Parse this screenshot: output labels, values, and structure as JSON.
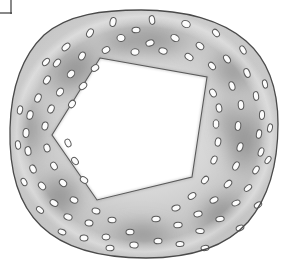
{
  "figure": {
    "title": "Stem cross-section",
    "style": "grayscale pencil and wash scientific illustration",
    "canvas": {
      "width": 282,
      "height": 263,
      "background": "#ffffff"
    }
  },
  "corner_mark": {
    "name": "crop-corner-bracket",
    "visible": true,
    "color": "#3a3a3a",
    "vertical_x": 11,
    "vertical_y0": 0,
    "vertical_y1": 14,
    "horizontal_y": 13,
    "horizontal_x0": 0,
    "horizontal_x1": 12,
    "stroke_width": 1.2
  },
  "colors": {
    "outline": "#4b4b4b",
    "cortex_light": "#dcdcdc",
    "cortex_mid": "#bdbdbd",
    "cortex_dark": "#8a8a8a",
    "patch_dark": "#6b6b6b",
    "patch_darkest": "#4f4f4f",
    "cavity_fill": "#ffffff",
    "bundle_fill": "#fcfcfc",
    "bundle_outline": "#5a5a5a",
    "highlight": "#f2f2f2"
  },
  "outer_boundary": {
    "name": "epidermis-outline",
    "description": "irregular rounded outer wall of the stem",
    "stroke": "#4a4a4a",
    "stroke_width": 1.3,
    "path": "M 141 10 C 184 10 222 20 246 41 C 268 60 278 90 278 124 C 278 160 270 196 248 222 C 224 249 186 258 146 258 C 106 258 66 250 41 226 C 16 202 9 165 10 128 C 11 92 20 58 44 35 C 68 14 104 10 141 10 Z"
  },
  "inner_cavity": {
    "name": "central-pith-cavity",
    "description": "white irregular pentagonal hollow centre",
    "fill": "#ffffff",
    "stroke": "#5a5a5a",
    "stroke_width": 1.1,
    "vertices": [
      {
        "x": 100,
        "y": 58
      },
      {
        "x": 207,
        "y": 77
      },
      {
        "x": 192,
        "y": 177
      },
      {
        "x": 97,
        "y": 200
      },
      {
        "x": 52,
        "y": 135
      }
    ],
    "path": "M 100 58 L 207 77 L 192 177 L 97 200 L 52 135 Z"
  },
  "shading_patches": [
    {
      "name": "patch-upper-left",
      "cx": 75,
      "cy": 70,
      "rx": 42,
      "ry": 30,
      "rot": -38,
      "opacity": 0.62
    },
    {
      "name": "patch-top",
      "cx": 152,
      "cy": 40,
      "rx": 52,
      "ry": 22,
      "rot": 6,
      "opacity": 0.55
    },
    {
      "name": "patch-upper-right",
      "cx": 232,
      "cy": 72,
      "rx": 34,
      "ry": 26,
      "rot": 40,
      "opacity": 0.5
    },
    {
      "name": "patch-right",
      "cx": 244,
      "cy": 140,
      "rx": 27,
      "ry": 46,
      "rot": 4,
      "opacity": 0.62
    },
    {
      "name": "patch-lower-right",
      "cx": 219,
      "cy": 213,
      "rx": 40,
      "ry": 25,
      "rot": -38,
      "opacity": 0.55
    },
    {
      "name": "patch-bottom",
      "cx": 143,
      "cy": 234,
      "rx": 48,
      "ry": 21,
      "rot": 2,
      "opacity": 0.52
    },
    {
      "name": "patch-lower-left",
      "cx": 60,
      "cy": 196,
      "rx": 31,
      "ry": 32,
      "rot": 30,
      "opacity": 0.58
    },
    {
      "name": "patch-left",
      "cx": 30,
      "cy": 128,
      "rx": 20,
      "ry": 40,
      "rot": -6,
      "opacity": 0.48
    },
    {
      "name": "patch-inner-top",
      "cx": 120,
      "cy": 44,
      "rx": 30,
      "ry": 16,
      "rot": 10,
      "opacity": 0.4
    },
    {
      "name": "patch-inner-right",
      "cx": 226,
      "cy": 120,
      "rx": 18,
      "ry": 34,
      "rot": 0,
      "opacity": 0.38
    }
  ],
  "vascular_bundles": {
    "name": "vascular-bundle-set",
    "count": 92,
    "description": "small white ovals with dark outlines scattered through the cortex",
    "items": [
      {
        "x": 113,
        "y": 22,
        "rx": 3.0,
        "ry": 4.6,
        "rot": 12
      },
      {
        "x": 152,
        "y": 20,
        "rx": 4.4,
        "ry": 2.7,
        "rot": 80
      },
      {
        "x": 186,
        "y": 24,
        "rx": 3.4,
        "ry": 4.4,
        "rot": 115
      },
      {
        "x": 216,
        "y": 33,
        "rx": 2.8,
        "ry": 4.2,
        "rot": 140
      },
      {
        "x": 243,
        "y": 50,
        "rx": 2.6,
        "ry": 4.4,
        "rot": 150
      },
      {
        "x": 90,
        "y": 33,
        "rx": 3.0,
        "ry": 4.4,
        "rot": 30
      },
      {
        "x": 66,
        "y": 47,
        "rx": 2.8,
        "ry": 4.6,
        "rot": 48
      },
      {
        "x": 121,
        "y": 38,
        "rx": 3.4,
        "ry": 4.0,
        "rot": 95
      },
      {
        "x": 150,
        "y": 43,
        "rx": 3.0,
        "ry": 4.2,
        "rot": 70
      },
      {
        "x": 175,
        "y": 38,
        "rx": 3.2,
        "ry": 4.4,
        "rot": 120
      },
      {
        "x": 200,
        "y": 46,
        "rx": 3.0,
        "ry": 4.2,
        "rot": 130
      },
      {
        "x": 227,
        "y": 59,
        "rx": 2.8,
        "ry": 4.4,
        "rot": 145
      },
      {
        "x": 57,
        "y": 63,
        "rx": 2.8,
        "ry": 4.4,
        "rot": 40
      },
      {
        "x": 82,
        "y": 56,
        "rx": 3.0,
        "ry": 4.2,
        "rot": 28
      },
      {
        "x": 106,
        "y": 50,
        "rx": 3.0,
        "ry": 4.0,
        "rot": 60
      },
      {
        "x": 135,
        "y": 52,
        "rx": 3.2,
        "ry": 4.0,
        "rot": 85
      },
      {
        "x": 163,
        "y": 51,
        "rx": 3.0,
        "ry": 4.2,
        "rot": 105
      },
      {
        "x": 189,
        "y": 57,
        "rx": 3.0,
        "ry": 4.4,
        "rot": 125
      },
      {
        "x": 212,
        "y": 66,
        "rx": 2.8,
        "ry": 4.2,
        "rot": 140
      },
      {
        "x": 247,
        "y": 73,
        "rx": 2.8,
        "ry": 4.6,
        "rot": 158
      },
      {
        "x": 47,
        "y": 80,
        "rx": 3.0,
        "ry": 4.4,
        "rot": 32
      },
      {
        "x": 71,
        "y": 74,
        "rx": 3.2,
        "ry": 4.2,
        "rot": 42
      },
      {
        "x": 95,
        "y": 68,
        "rx": 3.0,
        "ry": 4.0,
        "rot": 55
      },
      {
        "x": 232,
        "y": 86,
        "rx": 2.8,
        "ry": 4.4,
        "rot": 162
      },
      {
        "x": 256,
        "y": 96,
        "rx": 2.6,
        "ry": 4.4,
        "rot": 172
      },
      {
        "x": 213,
        "y": 93,
        "rx": 3.0,
        "ry": 4.2,
        "rot": 150
      },
      {
        "x": 38,
        "y": 98,
        "rx": 3.0,
        "ry": 4.4,
        "rot": 22
      },
      {
        "x": 60,
        "y": 92,
        "rx": 3.2,
        "ry": 4.2,
        "rot": 34
      },
      {
        "x": 83,
        "y": 86,
        "rx": 3.0,
        "ry": 4.2,
        "rot": 48
      },
      {
        "x": 219,
        "y": 108,
        "rx": 2.8,
        "ry": 4.2,
        "rot": 168
      },
      {
        "x": 241,
        "y": 105,
        "rx": 2.8,
        "ry": 4.4,
        "rot": 176
      },
      {
        "x": 262,
        "y": 115,
        "rx": 2.6,
        "ry": 4.4,
        "rot": 182
      },
      {
        "x": 30,
        "y": 115,
        "rx": 3.0,
        "ry": 4.4,
        "rot": 14
      },
      {
        "x": 51,
        "y": 109,
        "rx": 3.0,
        "ry": 4.2,
        "rot": 24
      },
      {
        "x": 72,
        "y": 104,
        "rx": 3.0,
        "ry": 4.0,
        "rot": 36
      },
      {
        "x": 216,
        "y": 124,
        "rx": 2.8,
        "ry": 4.2,
        "rot": 180
      },
      {
        "x": 238,
        "y": 126,
        "rx": 2.8,
        "ry": 4.4,
        "rot": 186
      },
      {
        "x": 259,
        "y": 134,
        "rx": 2.6,
        "ry": 4.4,
        "rot": 190
      },
      {
        "x": 26,
        "y": 133,
        "rx": 3.0,
        "ry": 4.4,
        "rot": 4
      },
      {
        "x": 45,
        "y": 126,
        "rx": 3.0,
        "ry": 4.0,
        "rot": 12
      },
      {
        "x": 218,
        "y": 142,
        "rx": 2.8,
        "ry": 4.2,
        "rot": 192
      },
      {
        "x": 240,
        "y": 147,
        "rx": 2.8,
        "ry": 4.4,
        "rot": 198
      },
      {
        "x": 261,
        "y": 152,
        "rx": 2.6,
        "ry": 4.4,
        "rot": 200
      },
      {
        "x": 28,
        "y": 151,
        "rx": 3.0,
        "ry": 4.4,
        "rot": 352
      },
      {
        "x": 47,
        "y": 148,
        "rx": 3.0,
        "ry": 4.0,
        "rot": 344
      },
      {
        "x": 68,
        "y": 143,
        "rx": 2.8,
        "ry": 4.0,
        "rot": 336
      },
      {
        "x": 214,
        "y": 160,
        "rx": 2.8,
        "ry": 4.2,
        "rot": 204
      },
      {
        "x": 236,
        "y": 166,
        "rx": 2.8,
        "ry": 4.4,
        "rot": 210
      },
      {
        "x": 256,
        "y": 170,
        "rx": 2.6,
        "ry": 4.2,
        "rot": 214
      },
      {
        "x": 33,
        "y": 169,
        "rx": 3.0,
        "ry": 4.2,
        "rot": 336
      },
      {
        "x": 54,
        "y": 166,
        "rx": 3.0,
        "ry": 4.0,
        "rot": 328
      },
      {
        "x": 75,
        "y": 161,
        "rx": 2.8,
        "ry": 4.0,
        "rot": 320
      },
      {
        "x": 205,
        "y": 180,
        "rx": 2.8,
        "ry": 4.2,
        "rot": 220
      },
      {
        "x": 228,
        "y": 184,
        "rx": 2.8,
        "ry": 4.4,
        "rot": 226
      },
      {
        "x": 248,
        "y": 188,
        "rx": 2.6,
        "ry": 4.2,
        "rot": 230
      },
      {
        "x": 42,
        "y": 186,
        "rx": 3.0,
        "ry": 4.2,
        "rot": 318
      },
      {
        "x": 63,
        "y": 183,
        "rx": 3.0,
        "ry": 4.0,
        "rot": 310
      },
      {
        "x": 84,
        "y": 180,
        "rx": 2.8,
        "ry": 4.0,
        "rot": 304
      },
      {
        "x": 192,
        "y": 196,
        "rx": 2.8,
        "ry": 4.2,
        "rot": 236
      },
      {
        "x": 214,
        "y": 200,
        "rx": 2.8,
        "ry": 4.2,
        "rot": 242
      },
      {
        "x": 236,
        "y": 203,
        "rx": 2.6,
        "ry": 4.2,
        "rot": 248
      },
      {
        "x": 54,
        "y": 203,
        "rx": 3.0,
        "ry": 4.2,
        "rot": 302
      },
      {
        "x": 74,
        "y": 200,
        "rx": 3.0,
        "ry": 4.0,
        "rot": 294
      },
      {
        "x": 96,
        "y": 211,
        "rx": 2.8,
        "ry": 4.0,
        "rot": 288
      },
      {
        "x": 176,
        "y": 208,
        "rx": 2.8,
        "ry": 4.2,
        "rot": 252
      },
      {
        "x": 198,
        "y": 214,
        "rx": 2.8,
        "ry": 4.2,
        "rot": 258
      },
      {
        "x": 220,
        "y": 219,
        "rx": 2.6,
        "ry": 4.2,
        "rot": 262
      },
      {
        "x": 68,
        "y": 217,
        "rx": 3.0,
        "ry": 4.2,
        "rot": 288
      },
      {
        "x": 89,
        "y": 223,
        "rx": 3.0,
        "ry": 4.0,
        "rot": 280
      },
      {
        "x": 112,
        "y": 220,
        "rx": 2.8,
        "ry": 4.0,
        "rot": 274
      },
      {
        "x": 156,
        "y": 219,
        "rx": 2.8,
        "ry": 4.2,
        "rot": 266
      },
      {
        "x": 178,
        "y": 225,
        "rx": 2.8,
        "ry": 4.2,
        "rot": 268
      },
      {
        "x": 200,
        "y": 231,
        "rx": 2.6,
        "ry": 4.2,
        "rot": 272
      },
      {
        "x": 84,
        "y": 238,
        "rx": 3.0,
        "ry": 4.0,
        "rot": 276
      },
      {
        "x": 106,
        "y": 237,
        "rx": 3.0,
        "ry": 4.0,
        "rot": 270
      },
      {
        "x": 130,
        "y": 232,
        "rx": 2.8,
        "ry": 4.0,
        "rot": 268
      },
      {
        "x": 134,
        "y": 245,
        "rx": 3.0,
        "ry": 4.2,
        "rot": 272
      },
      {
        "x": 158,
        "y": 241,
        "rx": 2.8,
        "ry": 4.0,
        "rot": 268
      },
      {
        "x": 180,
        "y": 244,
        "rx": 2.6,
        "ry": 4.0,
        "rot": 266
      },
      {
        "x": 110,
        "y": 248,
        "rx": 2.8,
        "ry": 4.0,
        "rot": 272
      },
      {
        "x": 205,
        "y": 248,
        "rx": 2.6,
        "ry": 4.0,
        "rot": 264
      },
      {
        "x": 240,
        "y": 228,
        "rx": 2.6,
        "ry": 4.0,
        "rot": 250
      },
      {
        "x": 258,
        "y": 205,
        "rx": 2.6,
        "ry": 4.0,
        "rot": 238
      },
      {
        "x": 268,
        "y": 160,
        "rx": 2.4,
        "ry": 4.0,
        "rot": 214
      },
      {
        "x": 270,
        "y": 128,
        "rx": 2.4,
        "ry": 4.2,
        "rot": 192
      },
      {
        "x": 265,
        "y": 84,
        "rx": 2.4,
        "ry": 4.2,
        "rot": 166
      },
      {
        "x": 20,
        "y": 110,
        "rx": 2.6,
        "ry": 4.2,
        "rot": 12
      },
      {
        "x": 18,
        "y": 145,
        "rx": 2.6,
        "ry": 4.2,
        "rot": 352
      },
      {
        "x": 24,
        "y": 182,
        "rx": 2.6,
        "ry": 4.0,
        "rot": 332
      },
      {
        "x": 40,
        "y": 210,
        "rx": 2.6,
        "ry": 4.0,
        "rot": 310
      },
      {
        "x": 62,
        "y": 232,
        "rx": 2.6,
        "ry": 4.0,
        "rot": 290
      },
      {
        "x": 46,
        "y": 62,
        "rx": 2.6,
        "ry": 4.2,
        "rot": 44
      },
      {
        "x": 136,
        "y": 30,
        "rx": 2.8,
        "ry": 4.0,
        "rot": 88
      }
    ]
  }
}
